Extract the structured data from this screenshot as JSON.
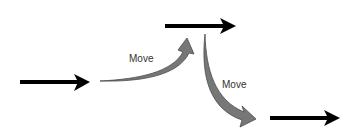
{
  "diagram": {
    "labels": {
      "move_up": "Move",
      "move_down": "Move"
    },
    "colors": {
      "arrow": "#000000",
      "curve_fill": "#777777",
      "curve_stroke": "#4a4a4a",
      "text": "#333333"
    },
    "arrows": [
      {
        "name": "left-arrow",
        "x1": 20,
        "y1": 82,
        "x2": 90,
        "y2": 82
      },
      {
        "name": "top-arrow",
        "x1": 165,
        "y1": 26,
        "x2": 236,
        "y2": 26
      },
      {
        "name": "bottom-right-arrow",
        "x1": 270,
        "y1": 118,
        "x2": 340,
        "y2": 118
      }
    ]
  }
}
